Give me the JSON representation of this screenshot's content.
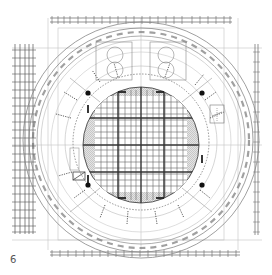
{
  "figure": {
    "label": "6",
    "type": "architectural-floor-plan"
  },
  "colors": {
    "background": "#ffffff",
    "line_dark": "#333333",
    "line_mid": "#777777",
    "line_light": "#b8b8b8",
    "hatch_fill": "#d0d0d0",
    "label": "#555555"
  }
}
